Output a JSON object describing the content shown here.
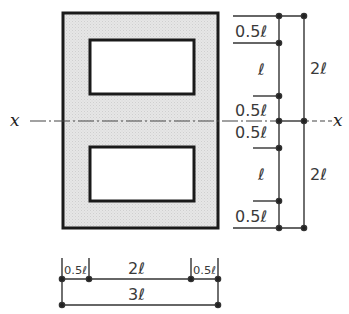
{
  "diagram": {
    "type": "cross-section-with-dimensions",
    "colors": {
      "fill": "#e4e4e4",
      "stroke": "#1a1a1a",
      "opening": "#ffffff",
      "dim_line": "#333333"
    },
    "axis": {
      "left_label": "x",
      "right_label": "x"
    },
    "vertical_dimensions": {
      "inner": [
        {
          "label": "0.5ℓ"
        },
        {
          "label": "ℓ"
        },
        {
          "label": "0.5ℓ"
        },
        {
          "label": "0.5ℓ"
        },
        {
          "label": "ℓ"
        },
        {
          "label": "0.5ℓ"
        }
      ],
      "outer": [
        {
          "label": "2ℓ"
        },
        {
          "label": "2ℓ"
        }
      ]
    },
    "horizontal_dimensions": {
      "inner": [
        {
          "label": "0.5ℓ"
        },
        {
          "label": "2ℓ"
        },
        {
          "label": "0.5ℓ"
        }
      ],
      "overall": {
        "label": "3ℓ"
      }
    }
  }
}
